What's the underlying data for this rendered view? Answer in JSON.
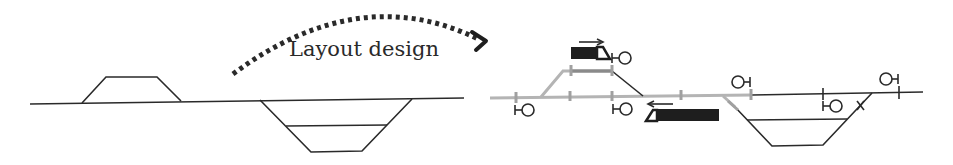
{
  "diagram": {
    "transition_label": "Layout design",
    "colors": {
      "line": "#2a2a2a",
      "track_grey": "#b4b4b4",
      "track_grey_dark": "#8a8a8a",
      "train": "#1e1e1e",
      "background": "#ffffff"
    },
    "left_panel": {
      "name": "Schematic track topology",
      "elements": [
        "main-line",
        "upper-siding-trapezoid",
        "lower-yard-trapezoid"
      ]
    },
    "right_panel": {
      "name": "Signalled railway layout",
      "trains": [
        {
          "id": "train-upper",
          "direction": "right"
        },
        {
          "id": "train-lower",
          "direction": "left"
        }
      ],
      "signals": [
        {
          "id": "signal-1",
          "facing": "right"
        },
        {
          "id": "signal-2",
          "facing": "right"
        },
        {
          "id": "signal-3",
          "facing": "right"
        },
        {
          "id": "signal-4",
          "facing": "left"
        },
        {
          "id": "signal-5",
          "facing": "right"
        },
        {
          "id": "signal-6",
          "facing": "left"
        }
      ]
    }
  }
}
